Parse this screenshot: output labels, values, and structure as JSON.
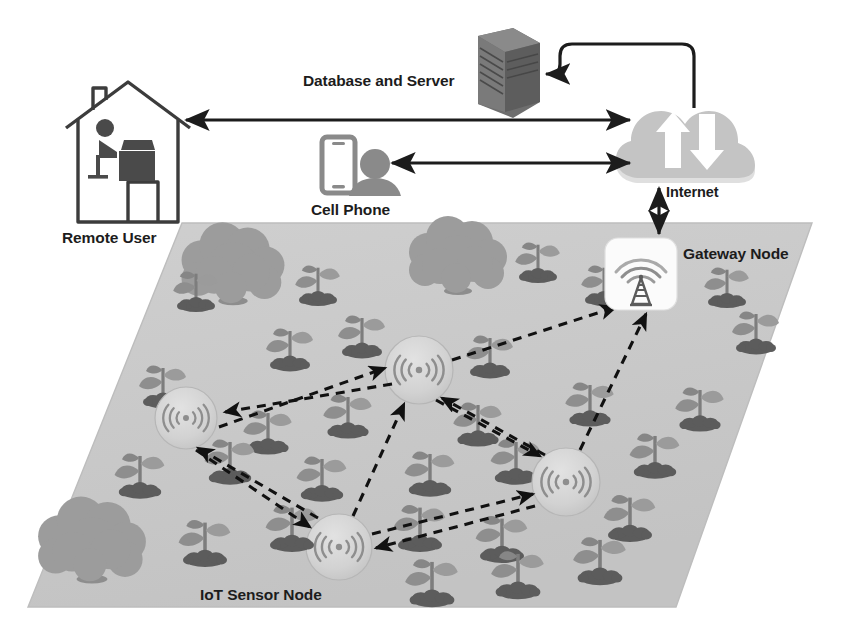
{
  "diagram": {
    "type": "network-architecture-diagram"
  },
  "labels": {
    "database_server": "Database and Server",
    "remote_user": "Remote User",
    "cell_phone": "Cell Phone",
    "internet": "Internet",
    "gateway_node": "Gateway Node",
    "iot_sensor_node": "IoT Sensor Node"
  },
  "colors": {
    "field": "#c9c9c9",
    "field_edge": "#b5b5b5",
    "tree_canopy": "#9a9a9a",
    "tree_trunk": "#8a8a8a",
    "plant_leaf": "#909090",
    "plant_stem": "#7e7e7e",
    "soil": "#5e5e5e",
    "cloud": "#c2c2c2",
    "server": "#6a6a6a",
    "node_fill": "#d4d4d4",
    "node_stroke": "#b0b0b0",
    "gateway_box": "#fbfbfb",
    "line": "#1c1c1c",
    "outline": "#3a3a3a",
    "icon_dark": "#777777",
    "text": "#1c1c1c"
  },
  "nodes": {
    "server": {
      "name": "Database and Server",
      "x": 500,
      "y": 72
    },
    "cloud": {
      "name": "Internet Cloud",
      "x": 690,
      "y": 135
    },
    "house": {
      "name": "Remote User House",
      "x": 128,
      "y": 165
    },
    "phone": {
      "name": "Cell Phone User",
      "x": 355,
      "y": 165
    },
    "gateway": {
      "name": "Gateway Node",
      "x": 641,
      "y": 277
    },
    "sensors": [
      {
        "id": "sensor-1",
        "x": 186,
        "y": 418,
        "r": 31
      },
      {
        "id": "sensor-2",
        "x": 419,
        "y": 370,
        "r": 34
      },
      {
        "id": "sensor-3",
        "x": 566,
        "y": 482,
        "r": 34
      },
      {
        "id": "sensor-4",
        "x": 339,
        "y": 547,
        "r": 33
      }
    ]
  },
  "links": {
    "solid": [
      {
        "from": "house",
        "to": "cloud",
        "arrows": "both"
      },
      {
        "from": "phone",
        "to": "cloud",
        "arrows": "both"
      },
      {
        "from": "cloud",
        "to": "server",
        "arrows": "to-server"
      },
      {
        "from": "cloud",
        "to": "gateway",
        "arrows": "both",
        "label": "Internet"
      }
    ],
    "dashed": [
      {
        "from": "sensor-2",
        "to": "sensor-1",
        "arrows": "to"
      },
      {
        "from": "sensor-1",
        "to": "sensor-2",
        "arrows": "to"
      },
      {
        "from": "sensor-2",
        "to": "gateway",
        "arrows": "to"
      },
      {
        "from": "sensor-3",
        "to": "sensor-2",
        "arrows": "to"
      },
      {
        "from": "sensor-4",
        "to": "sensor-2",
        "arrows": "to"
      },
      {
        "from": "sensor-3",
        "to": "gateway",
        "arrows": "to"
      },
      {
        "from": "sensor-2",
        "to": "sensor-3",
        "arrows": "to"
      },
      {
        "from": "sensor-1",
        "to": "sensor-4",
        "arrows": "to"
      },
      {
        "from": "sensor-4",
        "to": "sensor-1",
        "arrows": "to"
      },
      {
        "from": "sensor-4",
        "to": "sensor-3",
        "arrows": "to"
      },
      {
        "from": "sensor-3",
        "to": "sensor-4",
        "arrows": "to"
      }
    ]
  },
  "field": {
    "shape": "parallelogram",
    "corners": [
      [
        182,
        223
      ],
      [
        812,
        223
      ],
      [
        676,
        607
      ],
      [
        28,
        607
      ]
    ]
  },
  "trees": [
    {
      "x": 233,
      "y": 268,
      "scale": 1.0
    },
    {
      "x": 455,
      "y": 252,
      "scale": 0.95
    },
    {
      "x": 90,
      "y": 515,
      "scale": 1.0
    }
  ],
  "plants": [
    {
      "x": 196,
      "y": 300
    },
    {
      "x": 316,
      "y": 268
    },
    {
      "x": 378,
      "y": 290
    },
    {
      "x": 530,
      "y": 265
    },
    {
      "x": 598,
      "y": 295
    },
    {
      "x": 706,
      "y": 280
    },
    {
      "x": 145,
      "y": 380
    },
    {
      "x": 268,
      "y": 345
    },
    {
      "x": 340,
      "y": 330
    },
    {
      "x": 470,
      "y": 350
    },
    {
      "x": 740,
      "y": 330
    },
    {
      "x": 255,
      "y": 425
    },
    {
      "x": 330,
      "y": 410
    },
    {
      "x": 460,
      "y": 420
    },
    {
      "x": 560,
      "y": 400
    },
    {
      "x": 690,
      "y": 400
    },
    {
      "x": 130,
      "y": 470
    },
    {
      "x": 215,
      "y": 455
    },
    {
      "x": 300,
      "y": 470
    },
    {
      "x": 410,
      "y": 465
    },
    {
      "x": 500,
      "y": 455
    },
    {
      "x": 640,
      "y": 450
    },
    {
      "x": 185,
      "y": 535
    },
    {
      "x": 270,
      "y": 520
    },
    {
      "x": 400,
      "y": 520
    },
    {
      "x": 480,
      "y": 530
    },
    {
      "x": 620,
      "y": 510
    },
    {
      "x": 420,
      "y": 585
    },
    {
      "x": 505,
      "y": 575
    },
    {
      "x": 580,
      "y": 560
    }
  ],
  "icons": {
    "server": "server-rack-icon",
    "cloud": "cloud-upload-download-icon",
    "house": "house-remote-user-icon",
    "phone": "mobile-phone-icon",
    "person": "person-silhouette-icon",
    "gateway": "radio-tower-icon",
    "sensor": "wireless-signal-icon"
  }
}
